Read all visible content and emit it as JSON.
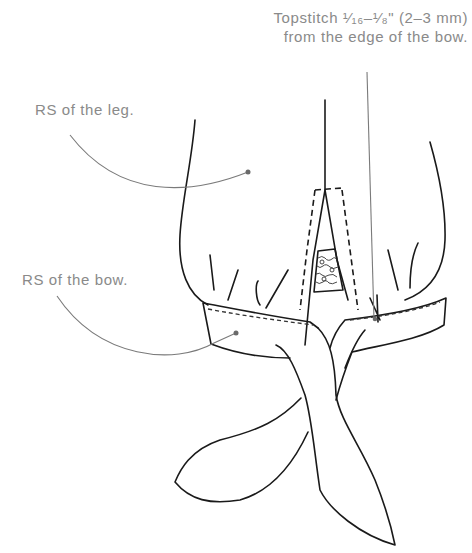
{
  "annotations": {
    "topstitch": {
      "line1": "Topstitch ¹⁄₁₆–¹⁄₈\" (2–3 mm)",
      "line2": "from the edge of the bow."
    },
    "leg": "RS of the leg.",
    "bow": "RS of the bow."
  },
  "colors": {
    "ink": "#1a1a1a",
    "label_text": "#8a8a8a",
    "leader_line": "#7a7a7a",
    "background": "#ffffff"
  }
}
